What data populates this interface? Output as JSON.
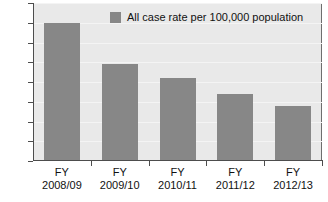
{
  "chart_data": {
    "type": "bar",
    "title": "",
    "subtitle": "",
    "xlabel": "",
    "ylabel": "",
    "categories": [
      "FY\n2008/09",
      "FY\n2009/10",
      "FY\n2010/11",
      "FY\n2011/12",
      "FY\n2012/13"
    ],
    "category_lines": [
      {
        "line1": "FY",
        "line2": "2008/09"
      },
      {
        "line1": "FY",
        "line2": "2009/10"
      },
      {
        "line1": "FY",
        "line2": "2010/11"
      },
      {
        "line1": "FY",
        "line2": "2011/12"
      },
      {
        "line1": "FY",
        "line2": "2012/13"
      }
    ],
    "series": [
      {
        "name": "All case rate per 100,000 population",
        "color": "#878787",
        "values": [
          70,
          49,
          42,
          34,
          28
        ]
      }
    ],
    "values": [
      70,
      49,
      42,
      34,
      28
    ],
    "ylim": [
      0,
      80
    ],
    "ytick_step": 10,
    "yticks": [
      80,
      70,
      60,
      50,
      40,
      30,
      20,
      10,
      0
    ],
    "ytick_labels": [
      "80",
      "70",
      "60",
      "50",
      "40",
      "30",
      "20",
      "10",
      "0"
    ],
    "grid": true,
    "grid_axis": "y",
    "legend": {
      "position": "top-center",
      "entries": [
        {
          "label": "All case rate per 100,000 population",
          "color": "#878787",
          "marker": "square"
        }
      ]
    },
    "colors": {
      "bar": "#878787",
      "plot_background": "#e9e9e9",
      "gridline": "#f4f4f4",
      "axis": "#4d4d4d",
      "text": "#111111",
      "page_background": "#ffffff"
    }
  }
}
